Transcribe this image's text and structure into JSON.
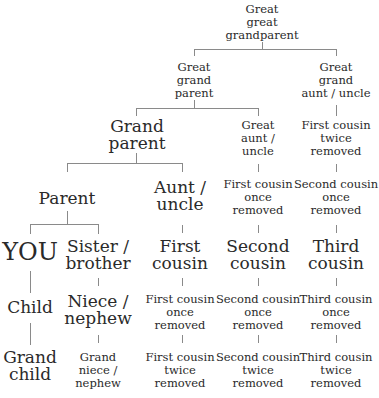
{
  "title_fragment": "... y g    g ...",
  "tree": {
    "great_great_grandparent": [
      "Great",
      "great",
      "grandparent"
    ],
    "great_grandparent": [
      "Great",
      "grand",
      "parent"
    ],
    "great_grand_aunt_uncle": [
      "Great",
      "grand",
      "aunt / uncle"
    ],
    "grandparent": [
      "Grand",
      "parent"
    ],
    "great_aunt_uncle": [
      "Great",
      "aunt /",
      "uncle"
    ],
    "first_cousin_twice_removed_upper": [
      "First cousin",
      "twice",
      "removed"
    ],
    "parent": [
      "Parent"
    ],
    "aunt_uncle": [
      "Aunt /",
      "uncle"
    ],
    "first_cousin_once_removed_upper": [
      "First cousin",
      "once",
      "removed"
    ],
    "second_cousin_once_removed_upper": [
      "Second cousin",
      "once",
      "removed"
    ],
    "you": [
      "YOU"
    ],
    "sister_brother": [
      "Sister /",
      "brother"
    ],
    "first_cousin": [
      "First",
      "cousin"
    ],
    "second_cousin": [
      "Second",
      "cousin"
    ],
    "third_cousin": [
      "Third",
      "cousin"
    ],
    "child": [
      "Child"
    ],
    "niece_nephew": [
      "Niece /",
      "nephew"
    ],
    "first_cousin_once_removed": [
      "First cousin",
      "once",
      "removed"
    ],
    "second_cousin_once_removed": [
      "Second cousin",
      "once",
      "removed"
    ],
    "third_cousin_once_removed": [
      "Third cousin",
      "once",
      "removed"
    ],
    "grandchild": [
      "Grand",
      "child"
    ],
    "grand_niece_nephew": [
      "Grand",
      "niece /",
      "nephew"
    ],
    "first_cousin_twice_removed": [
      "First cousin",
      "twice",
      "removed"
    ],
    "second_cousin_twice_removed": [
      "Second cousin",
      "twice",
      "removed"
    ],
    "third_cousin_twice_removed": [
      "Third cousin",
      "twice",
      "removed"
    ]
  },
  "colors": {
    "text": "#2a2a2a",
    "line": "#8a8a8a",
    "background": "#ffffff"
  }
}
